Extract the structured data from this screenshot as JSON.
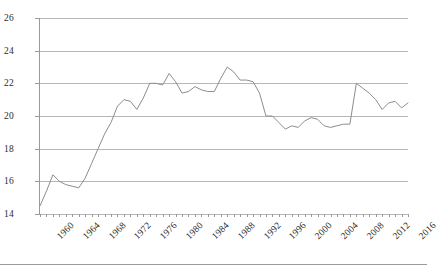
{
  "chart_data": {
    "type": "line",
    "title": "",
    "subtitle": "",
    "xlabel": "",
    "ylabel": "",
    "grid": true,
    "legend": false,
    "xlim": [
      1960,
      2017
    ],
    "ylim": [
      14,
      26
    ],
    "y_ticks": [
      14,
      16,
      18,
      20,
      22,
      24,
      26
    ],
    "x_tick_labels": [
      "1960",
      "1964",
      "1968",
      "1972",
      "1976",
      "1980",
      "1984",
      "1988",
      "1992",
      "1996",
      "2000",
      "2004",
      "2008",
      "2012",
      "2016"
    ],
    "x": [
      1960,
      1961,
      1962,
      1963,
      1964,
      1965,
      1966,
      1967,
      1968,
      1969,
      1970,
      1971,
      1972,
      1973,
      1974,
      1975,
      1976,
      1977,
      1978,
      1979,
      1980,
      1981,
      1982,
      1983,
      1984,
      1985,
      1986,
      1987,
      1988,
      1989,
      1990,
      1991,
      1992,
      1993,
      1994,
      1995,
      1996,
      1997,
      1998,
      1999,
      2000,
      2001,
      2002,
      2003,
      2004,
      2005,
      2006,
      2007,
      2008,
      2009,
      2010,
      2011,
      2012,
      2013,
      2014,
      2015,
      2016,
      2017
    ],
    "series": [
      {
        "name": "series-1",
        "color": "#8d8d8d",
        "values": [
          14.5,
          15.4,
          16.4,
          16.0,
          15.8,
          15.7,
          15.6,
          16.2,
          17.1,
          18.0,
          18.9,
          19.6,
          20.6,
          21.0,
          20.9,
          20.4,
          21.1,
          22.0,
          22.0,
          21.9,
          22.6,
          22.1,
          21.4,
          21.5,
          21.8,
          21.6,
          21.5,
          21.5,
          22.3,
          23.0,
          22.7,
          22.2,
          22.2,
          22.1,
          21.4,
          20.0,
          20.0,
          19.6,
          19.2,
          19.4,
          19.3,
          19.7,
          19.9,
          19.8,
          19.4,
          19.3,
          19.4,
          19.5,
          19.5,
          22.0,
          21.7,
          21.4,
          21.0,
          20.4,
          20.8,
          20.9,
          20.5,
          20.8
        ]
      }
    ]
  },
  "axes": {
    "y_tick_values": [
      "26",
      "24",
      "22",
      "20",
      "18",
      "16",
      "14"
    ]
  }
}
